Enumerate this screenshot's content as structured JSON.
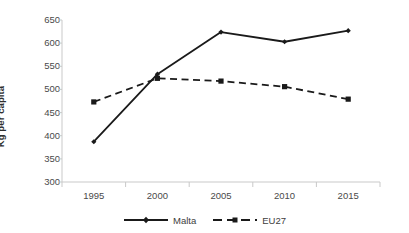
{
  "chart_data": {
    "type": "line",
    "title": "",
    "subtitle": "",
    "xlabel": "",
    "ylabel": "Kg per capita",
    "categories": [
      "1995",
      "2000",
      "2005",
      "2010",
      "2015"
    ],
    "x": [
      1995,
      2000,
      2005,
      2010,
      2015
    ],
    "series": [
      {
        "name": "Malta",
        "values": [
          387,
          533,
          624,
          603,
          627
        ],
        "line_style": "solid",
        "marker": "diamond",
        "color": "#1a1a1a"
      },
      {
        "name": "EU27",
        "values": [
          473,
          524,
          518,
          506,
          479
        ],
        "line_style": "dashed",
        "marker": "square",
        "color": "#1a1a1a"
      }
    ],
    "ylim": [
      300,
      650
    ],
    "ytick_step": 50,
    "yticks": [
      650,
      600,
      550,
      500,
      450,
      400,
      350,
      300
    ],
    "ytick_labels": [
      "650",
      "600",
      "550",
      "500",
      "450",
      "400",
      "350",
      "300"
    ],
    "xticks": [
      "1995",
      "2000",
      "2005",
      "2010",
      "2015"
    ],
    "grid": false,
    "legend_position": "bottom",
    "axis_color": "#c8c8c8",
    "background": "#ffffff",
    "text_color": "#4a4a4a"
  },
  "legend": {
    "items": [
      {
        "label": "Malta",
        "style": "solid",
        "marker": "diamond"
      },
      {
        "label": "EU27",
        "style": "dashed",
        "marker": "square"
      }
    ]
  }
}
